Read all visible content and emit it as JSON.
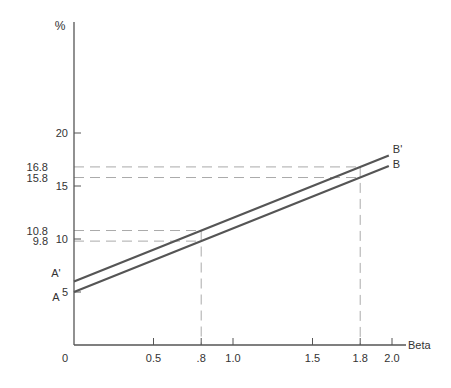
{
  "chart_data": {
    "type": "line",
    "title": "",
    "xlabel": "Beta",
    "ylabel": "%",
    "origin_label": "0",
    "xlim": [
      0,
      2.0
    ],
    "ylim": [
      0,
      25
    ],
    "x_ticks": [
      {
        "value": 0.5,
        "label": "0.5"
      },
      {
        "value": 0.8,
        "label": ".8"
      },
      {
        "value": 1.0,
        "label": "1.0"
      },
      {
        "value": 1.5,
        "label": "1.5"
      },
      {
        "value": 1.8,
        "label": "1.8"
      },
      {
        "value": 2.0,
        "label": "2.0"
      }
    ],
    "y_ticks": [
      {
        "value": 5,
        "label": "5"
      },
      {
        "value": 10,
        "label": "10"
      },
      {
        "value": 15,
        "label": "15"
      },
      {
        "value": 20,
        "label": "20"
      }
    ],
    "series": [
      {
        "name": "A'",
        "end_label": "B'",
        "x": [
          0,
          0.8,
          1.8,
          2.0
        ],
        "values": [
          6.0,
          10.8,
          16.8,
          18.0
        ]
      },
      {
        "name": "A",
        "end_label": "B",
        "x": [
          0,
          0.8,
          1.8,
          2.0
        ],
        "values": [
          5.0,
          9.8,
          15.8,
          17.0
        ]
      }
    ],
    "reference_lines": [
      {
        "y": 16.8,
        "x": 1.8,
        "label": "16.8"
      },
      {
        "y": 15.8,
        "x": 1.8,
        "label": "15.8"
      },
      {
        "y": 10.8,
        "x": 0.8,
        "label": "10.8"
      },
      {
        "y": 9.8,
        "x": 0.8,
        "label": "9.8"
      }
    ],
    "grid": false,
    "legend": "none"
  }
}
